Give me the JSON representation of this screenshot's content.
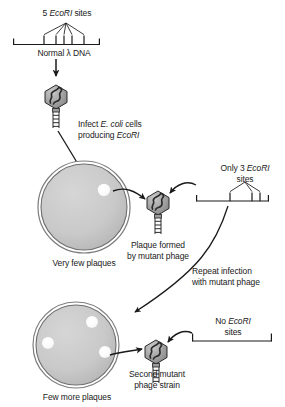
{
  "diagram": {
    "title_absent": true,
    "colors": {
      "stroke": "#1a1a1a",
      "dish_fill": "#c8c8c8",
      "dish_rim": "#b4b4b4",
      "phage_head": "#9a9a9a",
      "phage_head_light": "#c4c4c4",
      "plaque": "#ffffff",
      "text": "#1a1a1a"
    }
  },
  "labels": {
    "five_sites": {
      "count": "5",
      "enzyme": "EcoRI",
      "suffix": " sites"
    },
    "normal_dna": {
      "pre": "Normal ",
      "lambda": "λ",
      "post": " DNA"
    },
    "infect": {
      "line1_pre": "Infect ",
      "line1_ital": "E. coli",
      "line1_post": " cells",
      "line2_pre": "producing ",
      "line2_ital": "EcoRI"
    },
    "very_few_plaques": "Very few plaques",
    "plaque_formed": {
      "line1": "Plaque formed",
      "line2": "by mutant phage"
    },
    "only_three": {
      "pre": "Only 3 ",
      "enzyme": "EcoRI",
      "line2": "sites"
    },
    "repeat_infection": {
      "line1": "Repeat infection",
      "line2": "with mutant phage"
    },
    "no_sites": {
      "pre": "No ",
      "enzyme": "EcoRI",
      "line2": "sites"
    },
    "second_mutant": {
      "line1": "Second mutant",
      "line2": "phage strain"
    },
    "few_more_plaques": "Few more plaques"
  },
  "dna_maps": [
    {
      "name": "normal-lambda-dna",
      "site_count": 5,
      "sites_label": "5 EcoRI sites"
    },
    {
      "name": "mutant-dna-three-sites",
      "site_count": 3,
      "sites_label": "Only 3 EcoRI sites"
    },
    {
      "name": "mutant-dna-no-sites",
      "site_count": 0,
      "sites_label": "No EcoRI sites"
    }
  ],
  "petri_dishes": [
    {
      "name": "dish-very-few-plaques",
      "plaque_count": 1,
      "caption": "Very few plaques"
    },
    {
      "name": "dish-few-more-plaques",
      "plaque_count": 3,
      "caption": "Few more plaques"
    }
  ],
  "phages": [
    {
      "name": "phage-normal-lambda"
    },
    {
      "name": "phage-first-mutant"
    },
    {
      "name": "phage-second-mutant"
    }
  ]
}
